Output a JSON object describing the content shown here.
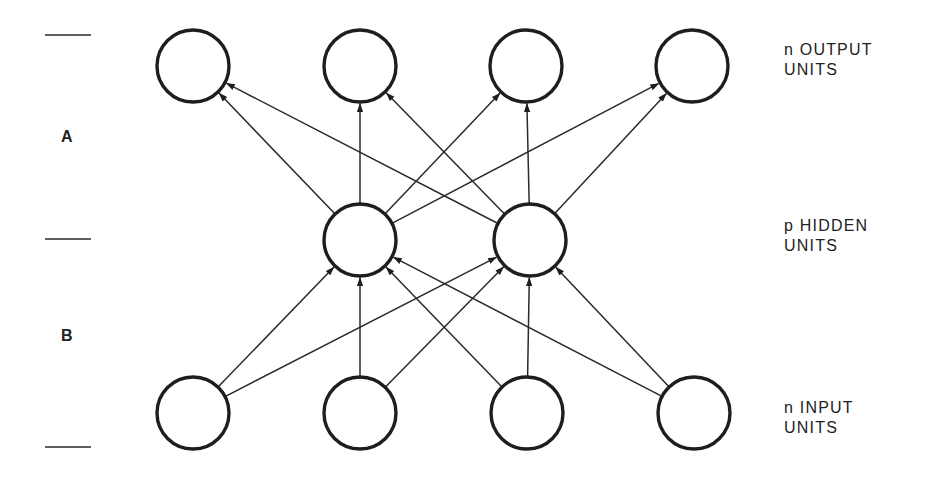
{
  "diagram": {
    "type": "neural-network",
    "layers": [
      {
        "id": "output",
        "label_line1": "n OUTPUT",
        "label_line2": "UNITS",
        "count": 4,
        "y": 66,
        "xs": [
          193,
          360,
          526,
          692
        ]
      },
      {
        "id": "hidden",
        "label_line1": "p HIDDEN",
        "label_line2": "UNITS",
        "count": 2,
        "y": 240,
        "xs": [
          360,
          530
        ]
      },
      {
        "id": "input",
        "label_line1": "n INPUT",
        "label_line2": "UNITS",
        "count": 4,
        "y": 413,
        "xs": [
          193,
          360,
          527,
          694
        ]
      }
    ],
    "node_radius": 36,
    "connections": [
      {
        "from": "input",
        "to": "hidden",
        "pattern": "fully-connected",
        "direction": "upward"
      },
      {
        "from": "hidden",
        "to": "output",
        "pattern": "fully-connected",
        "direction": "upward"
      }
    ],
    "sections": [
      {
        "id": "A",
        "label": "A",
        "between": [
          "hidden",
          "output"
        ]
      },
      {
        "id": "B",
        "label": "B",
        "between": [
          "input",
          "hidden"
        ]
      }
    ],
    "ticks_y": [
      35,
      239,
      447
    ],
    "colors": {
      "stroke": "#1e1e1e",
      "background": "#ffffff"
    }
  }
}
